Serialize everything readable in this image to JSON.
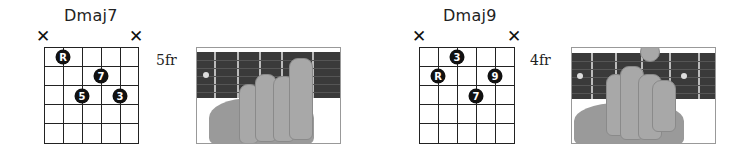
{
  "chords": [
    {
      "name": "Dmaj7",
      "fret_label": "5fr",
      "muted_strings": [
        "low-E",
        "high-E"
      ],
      "mute_symbol": "✕",
      "dots": [
        {
          "string": 2,
          "fret": 1,
          "label": "R"
        },
        {
          "string": 4,
          "fret": 2,
          "label": "7"
        },
        {
          "string": 3,
          "fret": 3,
          "label": "5"
        },
        {
          "string": 5,
          "fret": 3,
          "label": "3"
        }
      ],
      "photo": "hand-fretting-dmaj7-photo"
    },
    {
      "name": "Dmaj9",
      "fret_label": "4fr",
      "muted_strings": [
        "low-E",
        "high-E"
      ],
      "mute_symbol": "✕",
      "dots": [
        {
          "string": 3,
          "fret": 1,
          "label": "3"
        },
        {
          "string": 2,
          "fret": 2,
          "label": "R"
        },
        {
          "string": 5,
          "fret": 2,
          "label": "9"
        },
        {
          "string": 4,
          "fret": 3,
          "label": "7"
        }
      ],
      "photo": "hand-fretting-dmaj9-photo"
    }
  ]
}
